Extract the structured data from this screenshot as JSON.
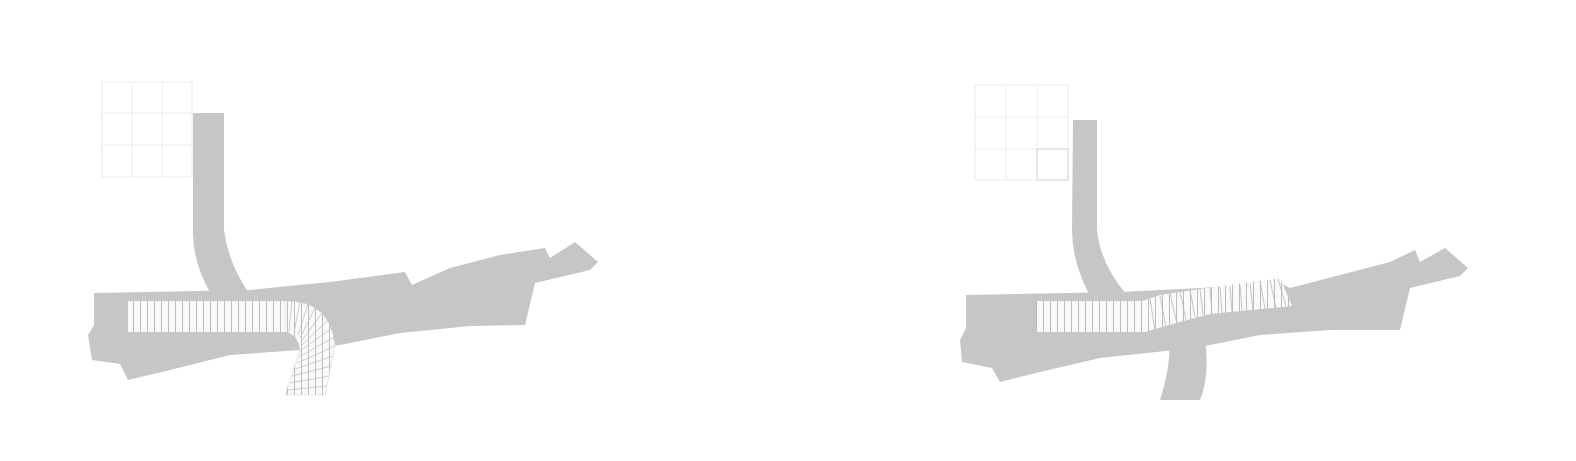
{
  "diagram": {
    "type": "site-plan-comparison",
    "panels": [
      {
        "id": "left",
        "variant": "curved-structure",
        "description": "Straight hatched block curving south at east end"
      },
      {
        "id": "right",
        "variant": "angled-structure",
        "description": "Straight hatched block extending east with a kink"
      }
    ],
    "colors": {
      "background": "#ffffff",
      "path_fill": "#c6c6c6",
      "structure_fill": "#fafafa",
      "hatch": "#b0b0b0",
      "grid": "#e6e6e6"
    }
  }
}
